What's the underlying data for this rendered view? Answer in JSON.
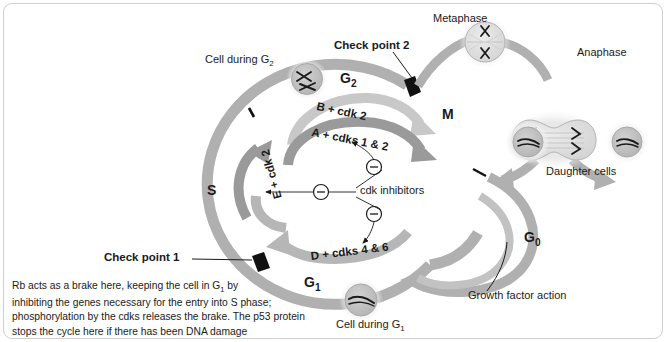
{
  "colors": {
    "ring_outer": "#b0b0b0",
    "ring_inner_light": "#c8c8c8",
    "ring_inner_dark": "#9a9a9a",
    "cell_fill": "#c0c0c0",
    "cell_halo": "#e3e3e3",
    "checkpoint_block": "#111111",
    "text": "#1a1a1a",
    "frame": "#cfcfcf",
    "background": "#ffffff"
  },
  "labels": {
    "cell_during_g2": "Cell during G",
    "cell_during_g2_sub": "2",
    "cell_during_g1": "Cell during G",
    "cell_during_g1_sub": "1",
    "metaphase": "Metaphase",
    "anaphase": "Anaphase",
    "daughter_cells": "Daughter cells",
    "growth_factor_action": "Growth factor action",
    "cdk_inhibitors": "cdk inhibitors",
    "check_point_1": "Check point 1",
    "check_point_2": "Check point 2"
  },
  "phases": {
    "g2": "G",
    "g2_sub": "2",
    "g1": "G",
    "g1_sub": "1",
    "g0": "G",
    "g0_sub": "0",
    "s": "S",
    "m": "M"
  },
  "cyclins": {
    "b_cdk2": "B + cdk 2",
    "a_cdks12": "A + cdks 1 & 2",
    "e_cdk2": "E + cdk 2",
    "d_cdks46": "D + cdks 4 & 6"
  },
  "inhibitor_symbol": "–",
  "caption": {
    "line1": "Rb acts as a brake here, keeping the cell in G",
    "line1_sub": "1",
    "line1_end": " by",
    "line2": "inhibiting the genes necessary for the entry into S phase;",
    "line3": "phosphorylation by the cdks releases the brake. The p53 protein",
    "line4": "stops the cycle here if there has been DNA damage"
  }
}
